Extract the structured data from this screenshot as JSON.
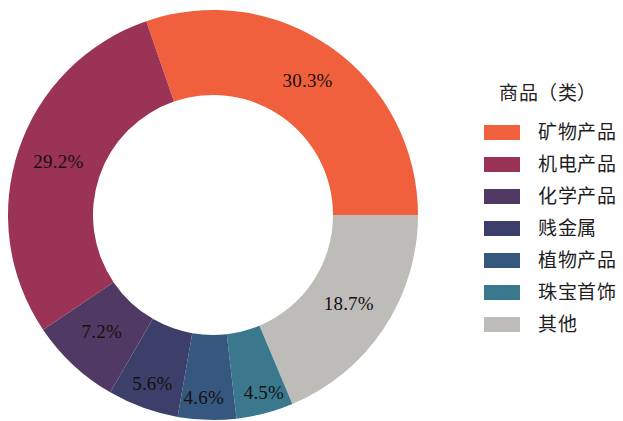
{
  "background_color": "#ffffff",
  "legend": {
    "title": "商品（类）",
    "position": "right",
    "items": [
      {
        "label": "矿物产品",
        "color": "#F0603C"
      },
      {
        "label": "机电产品",
        "color": "#9B3356"
      },
      {
        "label": "化学产品",
        "color": "#503A63"
      },
      {
        "label": "贱金属",
        "color": "#3D3F6B"
      },
      {
        "label": "植物产品",
        "color": "#36587F"
      },
      {
        "label": "珠宝首饰",
        "color": "#39788D"
      },
      {
        "label": "其他",
        "color": "#BEBCB8"
      }
    ]
  },
  "chart_data": {
    "type": "pie",
    "variant": "donut",
    "title": "",
    "subtitle": "",
    "xlabel": "",
    "ylabel": "",
    "legend_title": "商品（类）",
    "legend_position": "right",
    "grid": false,
    "units": "%",
    "start_angle_deg": -19,
    "direction": "clockwise",
    "inner_radius_ratio": 0.585,
    "categories": [
      "矿物产品",
      "其他",
      "珠宝首饰",
      "植物产品",
      "贱金属",
      "化学产品",
      "机电产品"
    ],
    "values": [
      30.3,
      18.7,
      4.5,
      4.6,
      5.6,
      7.2,
      29.2
    ],
    "slices": [
      {
        "name": "矿物产品",
        "value": 30.3,
        "label": "30.3%",
        "color": "#F0603C"
      },
      {
        "name": "其他",
        "value": 18.7,
        "label": "18.7%",
        "color": "#BEBCB8"
      },
      {
        "name": "珠宝首饰",
        "value": 4.5,
        "label": "4.5%",
        "color": "#39788D"
      },
      {
        "name": "植物产品",
        "value": 4.6,
        "label": "4.6%",
        "color": "#36587F"
      },
      {
        "name": "贱金属",
        "value": 5.6,
        "label": "5.6%",
        "color": "#3D3F6B"
      },
      {
        "name": "化学产品",
        "value": 7.2,
        "label": "7.2%",
        "color": "#503A63"
      },
      {
        "name": "机电产品",
        "value": 29.2,
        "label": "29.2%",
        "color": "#9B3356"
      }
    ],
    "labels": [
      "30.3%",
      "18.7%",
      "4.5%",
      "4.6%",
      "5.6%",
      "7.2%",
      "29.2%"
    ],
    "total": 100.1
  },
  "geometry": {
    "cx": 213,
    "cy": 215,
    "outer_radius": 205,
    "inner_radius": 120,
    "label_radius": 163
  }
}
